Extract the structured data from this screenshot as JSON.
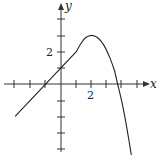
{
  "chart_data": {
    "type": "line",
    "title": "",
    "xlabel": "x",
    "ylabel": "y",
    "xlim": [
      -3.1,
      5.0
    ],
    "ylim": [
      -4.5,
      4.3
    ],
    "grid": false,
    "x_tick_labels": [
      {
        "value": 2,
        "label": "2"
      }
    ],
    "y_tick_labels": [
      {
        "value": 2,
        "label": "2"
      }
    ],
    "x_ticks": [
      -3,
      -2,
      -1,
      1,
      2,
      3,
      4,
      5
    ],
    "y_ticks": [
      -4,
      -3,
      -2,
      -1,
      1,
      2,
      3,
      4
    ],
    "series": [
      {
        "name": "f(x)",
        "description": "Linear segment y = x + 1 from x=-3 to x=1, then smooth curve peaking near (2,3), crossing x-axis near x≈3.7, falling off the bottom near x≈4.6",
        "x": [
          -3,
          -2,
          -1,
          0,
          1,
          1.3,
          1.6,
          2,
          2.4,
          2.8,
          3.2,
          3.5,
          3.7,
          4.0,
          4.3,
          4.6
        ],
        "y": [
          -2,
          -1,
          0,
          1,
          2,
          2.5,
          2.85,
          3,
          2.85,
          2.4,
          1.6,
          0.8,
          0,
          -1.2,
          -2.7,
          -4.4
        ]
      }
    ]
  },
  "labels": {
    "x_axis": "x",
    "y_axis": "y",
    "x_tick": "2",
    "y_tick": "2"
  },
  "colors": {
    "axis": "#333333",
    "curve": "#222222",
    "background": "#ffffff"
  }
}
